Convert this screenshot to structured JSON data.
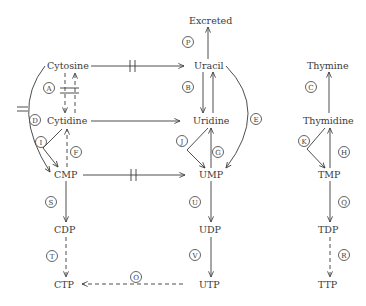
{
  "nodes": {
    "excreted": "Excreted",
    "cytosine": "Cytosine",
    "uracil": "Uracil",
    "thymine": "Thymine",
    "cytidine": "Cytidine",
    "uridine": "Uridine",
    "thymidine": "Thymidine",
    "cmp": "CMP",
    "ump": "UMP",
    "tmp": "TMP",
    "cdp": "CDP",
    "udp": "UDP",
    "tdp": "TDP",
    "ctp": "CTP",
    "utp": "UTP",
    "ttp": "TTP"
  },
  "labels": {
    "A": "A",
    "B": "B",
    "C": "C",
    "D": "D",
    "E": "E",
    "F": "F",
    "G": "G",
    "H": "H",
    "I": "I",
    "J": "J",
    "K": "K",
    "O": "O",
    "P": "P",
    "Q": "Q",
    "R": "R",
    "S": "S",
    "T": "T",
    "U": "U",
    "V": "V"
  }
}
